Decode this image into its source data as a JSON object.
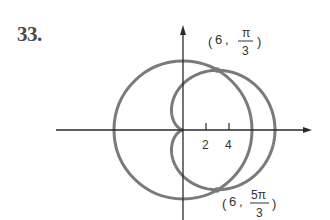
{
  "problem": {
    "number": "33."
  },
  "axes": {
    "origin_px": [
      183,
      130
    ],
    "unit_px": 11.5,
    "x_ticks": [
      {
        "value": 2,
        "label": "2"
      },
      {
        "value": 4,
        "label": "4"
      }
    ]
  },
  "curves": [
    {
      "name": "circle",
      "equation": "r = 6",
      "color": "#7a7a7a"
    },
    {
      "name": "cardioid",
      "equation": "r = 4 + 4cos(theta)",
      "color": "#7a7a7a"
    }
  ],
  "intersections": [
    {
      "label_r": "6",
      "label_num": "π",
      "label_den": "3"
    },
    {
      "label_r": "6",
      "label_num": "5π",
      "label_den": "3"
    }
  ],
  "colors": {
    "curve": "#7a7a7a",
    "axis": "#2a2a2a",
    "text": "#333333"
  }
}
